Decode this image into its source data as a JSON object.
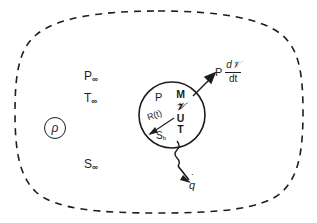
{
  "figure": {
    "background_color": "#ffffff",
    "ink_color": "#1d1d1d"
  },
  "far_field": {
    "pressure_symbol": "P",
    "pressure_subscript": "∞",
    "temperature_symbol": "T",
    "temperature_subscript": "∞",
    "entropy_symbol": "S",
    "entropy_subscript": "∞",
    "density_symbol": "ρ"
  },
  "bubble": {
    "pressure_label": "P",
    "state_stack": [
      "M",
      "𝒱",
      "U",
      "T"
    ],
    "radius_label": "R(t)",
    "surface_symbol": "S",
    "surface_subscript": "b"
  },
  "fluxes": {
    "work_pressure": "P",
    "work_numerator": "d𝒱",
    "work_denominator": "dt",
    "heat_symbol": "q",
    "heat_dot": "˙"
  },
  "boundary": {
    "outer_style": "dashed",
    "inner_style": "solid"
  }
}
